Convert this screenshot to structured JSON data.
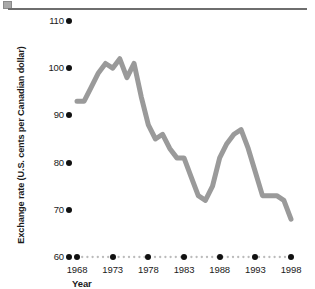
{
  "figure": {
    "header_rule": {
      "marker_name": "page-corner-marker",
      "line_color": "#6e6e6e"
    }
  },
  "chart_data": {
    "type": "line",
    "title": "",
    "xlabel": "Year",
    "ylabel": "Exchange rate (U.S. cents per Canadian dollar)",
    "xlim": [
      1967,
      1998.5
    ],
    "ylim": [
      60,
      110
    ],
    "grid": false,
    "legend": null,
    "line_color": "#9a9a9a",
    "line_width": 5,
    "axis_dot_color": "#111111",
    "dotted_baseline_color": "#bbbbbb",
    "y_ticks": [
      110,
      100,
      90,
      80,
      70,
      60
    ],
    "y_tick_labels": [
      "110",
      "100",
      "90",
      "80",
      "70",
      "60"
    ],
    "x_ticks": [
      1968,
      1973,
      1978,
      1983,
      1988,
      1993,
      1998
    ],
    "x_tick_labels": [
      "1968",
      "1973",
      "1978",
      "1983",
      "1988",
      "1993",
      "1998"
    ],
    "series": [
      {
        "name": "Exchange rate",
        "x": [
          1968,
          1969,
          1970,
          1971,
          1972,
          1973,
          1974,
          1975,
          1976,
          1977,
          1978,
          1979,
          1980,
          1981,
          1982,
          1983,
          1984,
          1985,
          1986,
          1987,
          1988,
          1989,
          1990,
          1991,
          1992,
          1993,
          1994,
          1995,
          1996,
          1997,
          1998
        ],
        "values": [
          93,
          93,
          96,
          99,
          101,
          100,
          102,
          98,
          101,
          94,
          88,
          85,
          86,
          83,
          81,
          81,
          77,
          73,
          72,
          75,
          81,
          84,
          86,
          87,
          83,
          78,
          73,
          73,
          73,
          72,
          68
        ]
      }
    ]
  }
}
